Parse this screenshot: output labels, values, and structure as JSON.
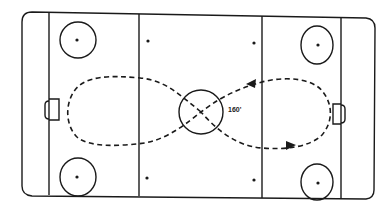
{
  "diagram": {
    "type": "ice-hockey-rink-drill",
    "pattern": "figure-eight skating path",
    "label": "160'",
    "colors": {
      "line": "#1a1a1a",
      "background": "#ffffff"
    },
    "elements": {
      "boards": "rounded rectangle rink outline",
      "goal_lines": 2,
      "blue_lines": 2,
      "center_circle": "with X at center faceoff spot",
      "faceoff_circles": 4,
      "neutral_zone_dots": 4,
      "goals": 2,
      "path_arrows": 2
    }
  }
}
